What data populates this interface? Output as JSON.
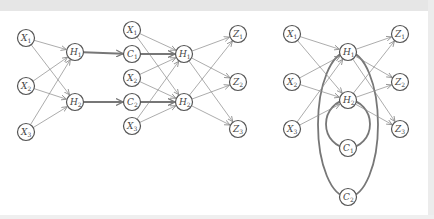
{
  "diagram": {
    "title": "",
    "colors": {
      "node_stroke": "#555555",
      "edge": "#888888",
      "thick_edge": "#777777",
      "background": "#ffffff"
    },
    "panels": [
      {
        "id": "left",
        "nodes": [
          {
            "id": "L_X1",
            "var": "X",
            "sub": "1",
            "x": 26,
            "y": 38
          },
          {
            "id": "L_X2",
            "var": "X",
            "sub": "2",
            "x": 26,
            "y": 86
          },
          {
            "id": "L_X3",
            "var": "X",
            "sub": "3",
            "x": 26,
            "y": 132
          },
          {
            "id": "L_H1",
            "var": "H",
            "sub": "1",
            "x": 75,
            "y": 52
          },
          {
            "id": "L_H2",
            "var": "H",
            "sub": "2",
            "x": 75,
            "y": 102
          },
          {
            "id": "L_C1",
            "var": "C",
            "sub": "1",
            "x": 132,
            "y": 54
          },
          {
            "id": "L_C2",
            "var": "C",
            "sub": "2",
            "x": 132,
            "y": 102
          },
          {
            "id": "L_X1b",
            "var": "X",
            "sub": "1",
            "x": 132,
            "y": 30
          },
          {
            "id": "L_X2b",
            "var": "X",
            "sub": "2",
            "x": 132,
            "y": 78
          },
          {
            "id": "L_X3b",
            "var": "X",
            "sub": "3",
            "x": 132,
            "y": 126
          },
          {
            "id": "L_H1b",
            "var": "H",
            "sub": "1",
            "x": 184,
            "y": 54
          },
          {
            "id": "L_H2b",
            "var": "H",
            "sub": "2",
            "x": 184,
            "y": 102
          },
          {
            "id": "L_Z1",
            "var": "Z",
            "sub": "1",
            "x": 238,
            "y": 34
          },
          {
            "id": "L_Z2",
            "var": "Z",
            "sub": "2",
            "x": 238,
            "y": 82
          },
          {
            "id": "L_Z3",
            "var": "Z",
            "sub": "3",
            "x": 238,
            "y": 129
          }
        ]
      },
      {
        "id": "right",
        "nodes": [
          {
            "id": "R_X1",
            "var": "X",
            "sub": "1",
            "x": 292,
            "y": 34
          },
          {
            "id": "R_X2",
            "var": "X",
            "sub": "2",
            "x": 292,
            "y": 82
          },
          {
            "id": "R_X3",
            "var": "X",
            "sub": "3",
            "x": 292,
            "y": 129
          },
          {
            "id": "R_H1",
            "var": "H",
            "sub": "1",
            "x": 348,
            "y": 52
          },
          {
            "id": "R_H2",
            "var": "H",
            "sub": "2",
            "x": 348,
            "y": 100
          },
          {
            "id": "R_C1",
            "var": "C",
            "sub": "1",
            "x": 348,
            "y": 148
          },
          {
            "id": "R_C2",
            "var": "C",
            "sub": "2",
            "x": 348,
            "y": 197
          },
          {
            "id": "R_Z1",
            "var": "Z",
            "sub": "1",
            "x": 400,
            "y": 34
          },
          {
            "id": "R_Z2",
            "var": "Z",
            "sub": "2",
            "x": 400,
            "y": 82
          },
          {
            "id": "R_Z3",
            "var": "Z",
            "sub": "3",
            "x": 400,
            "y": 129
          }
        ]
      }
    ],
    "edges": [
      [
        "L_X1",
        "L_H1"
      ],
      [
        "L_X1",
        "L_H2"
      ],
      [
        "L_X2",
        "L_H1"
      ],
      [
        "L_X2",
        "L_H2"
      ],
      [
        "L_X3",
        "L_H1"
      ],
      [
        "L_X3",
        "L_H2"
      ],
      [
        "L_X1b",
        "L_H1b"
      ],
      [
        "L_X1b",
        "L_H2b"
      ],
      [
        "L_X2b",
        "L_H1b"
      ],
      [
        "L_X2b",
        "L_H2b"
      ],
      [
        "L_X3b",
        "L_H1b"
      ],
      [
        "L_X3b",
        "L_H2b"
      ],
      [
        "L_H1b",
        "L_Z1"
      ],
      [
        "L_H1b",
        "L_Z2"
      ],
      [
        "L_H1b",
        "L_Z3"
      ],
      [
        "L_H2b",
        "L_Z1"
      ],
      [
        "L_H2b",
        "L_Z2"
      ],
      [
        "L_H2b",
        "L_Z3"
      ],
      [
        "R_X1",
        "R_H1"
      ],
      [
        "R_X1",
        "R_H2"
      ],
      [
        "R_X2",
        "R_H1"
      ],
      [
        "R_X2",
        "R_H2"
      ],
      [
        "R_X3",
        "R_H1"
      ],
      [
        "R_X3",
        "R_H2"
      ],
      [
        "R_H1",
        "R_Z1"
      ],
      [
        "R_H1",
        "R_Z2"
      ],
      [
        "R_H1",
        "R_Z3"
      ],
      [
        "R_H2",
        "R_Z1"
      ],
      [
        "R_H2",
        "R_Z2"
      ],
      [
        "R_H2",
        "R_Z3"
      ]
    ],
    "thick_edges": [
      [
        "L_H1",
        "L_C1"
      ],
      [
        "L_H2",
        "L_C2"
      ],
      [
        "L_C1",
        "L_H1b"
      ],
      [
        "L_C2",
        "L_H2b"
      ]
    ],
    "loops": [
      {
        "between": [
          "R_H2",
          "R_C1"
        ],
        "rx": 22
      },
      {
        "between": [
          "R_H1",
          "R_C2"
        ],
        "rx": 30
      }
    ]
  }
}
